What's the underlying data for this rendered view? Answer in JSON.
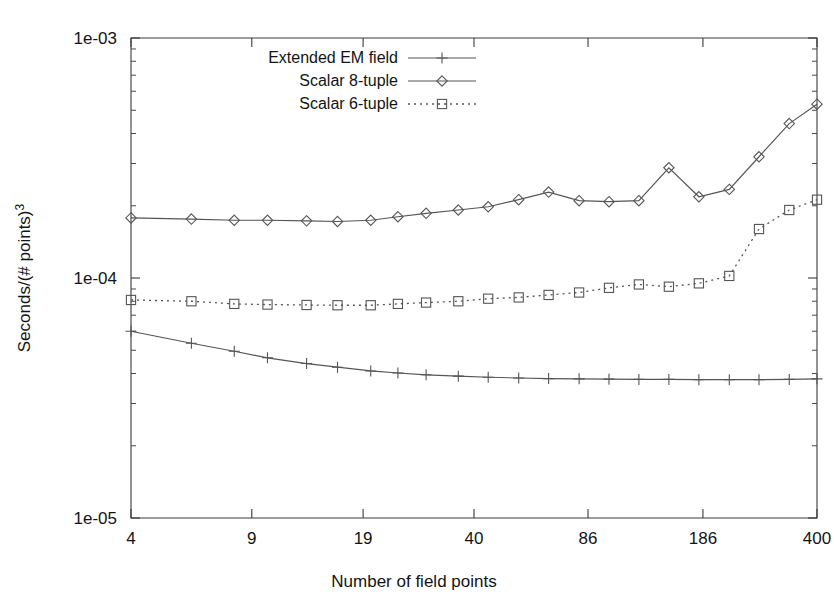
{
  "chart_data": {
    "type": "line",
    "title": "",
    "xlabel": "Number of field points",
    "ylabel": "Seconds/(# points)3",
    "ylabel_base": "Seconds/(# points)",
    "ylabel_exponent": "3",
    "xscale": "log",
    "yscale": "log",
    "xlim": [
      4,
      400
    ],
    "ylim": [
      1e-05,
      0.001
    ],
    "xticks": [
      4,
      9,
      19,
      40,
      86,
      186,
      400
    ],
    "xtick_labels": [
      "4",
      "9",
      "19",
      "40",
      "86",
      "186",
      "400"
    ],
    "yticks": [
      1e-05,
      0.0001,
      0.001
    ],
    "ytick_labels": [
      "1e-05",
      "1e-04",
      "1e-03"
    ],
    "grid": false,
    "legend_position": "top-left-inside",
    "series": [
      {
        "name": "Extended EM field",
        "marker": "plus",
        "linestyle": "solid",
        "color": "#555555",
        "x": [
          4,
          6,
          8,
          10,
          13,
          16,
          20,
          24,
          29,
          36,
          44,
          54,
          66,
          81,
          99,
          121,
          148,
          181,
          222,
          271,
          332,
          400
        ],
        "y": [
          6e-05,
          5.35e-05,
          4.95e-05,
          4.65e-05,
          4.4e-05,
          4.25e-05,
          4.1e-05,
          4.02e-05,
          3.95e-05,
          3.9e-05,
          3.86e-05,
          3.83e-05,
          3.81e-05,
          3.8e-05,
          3.79e-05,
          3.78e-05,
          3.78e-05,
          3.77e-05,
          3.77e-05,
          3.77e-05,
          3.78e-05,
          3.8e-05
        ]
      },
      {
        "name": "Scalar 8-tuple",
        "marker": "diamond",
        "linestyle": "solid",
        "color": "#555555",
        "x": [
          4,
          6,
          8,
          10,
          13,
          16,
          20,
          24,
          29,
          36,
          44,
          54,
          66,
          81,
          99,
          121,
          148,
          181,
          222,
          271,
          332,
          400
        ],
        "y": [
          0.000178,
          0.000176,
          0.000174,
          0.000174,
          0.000173,
          0.000172,
          0.000174,
          0.00018,
          0.000186,
          0.000192,
          0.000198,
          0.000212,
          0.000228,
          0.00021,
          0.000208,
          0.00021,
          0.000288,
          0.000218,
          0.000234,
          0.00032,
          0.00044,
          0.00053
        ]
      },
      {
        "name": "Scalar 6-tuple",
        "marker": "square",
        "linestyle": "dotted",
        "color": "#555555",
        "x": [
          4,
          6,
          8,
          10,
          13,
          16,
          20,
          24,
          29,
          36,
          44,
          54,
          66,
          81,
          99,
          121,
          148,
          181,
          222,
          271,
          332,
          400
        ],
        "y": [
          8.1e-05,
          8e-05,
          7.8e-05,
          7.75e-05,
          7.72e-05,
          7.7e-05,
          7.7e-05,
          7.8e-05,
          7.9e-05,
          8e-05,
          8.2e-05,
          8.3e-05,
          8.5e-05,
          8.7e-05,
          9.1e-05,
          9.4e-05,
          9.2e-05,
          9.5e-05,
          0.000102,
          0.00016,
          0.000192,
          0.000212
        ]
      }
    ]
  },
  "legend": {
    "entries": [
      {
        "label": "Extended EM field",
        "marker": "plus",
        "linestyle": "solid"
      },
      {
        "label": "Scalar 8-tuple",
        "marker": "diamond",
        "linestyle": "solid"
      },
      {
        "label": "Scalar 6-tuple",
        "marker": "square",
        "linestyle": "dotted"
      }
    ]
  }
}
